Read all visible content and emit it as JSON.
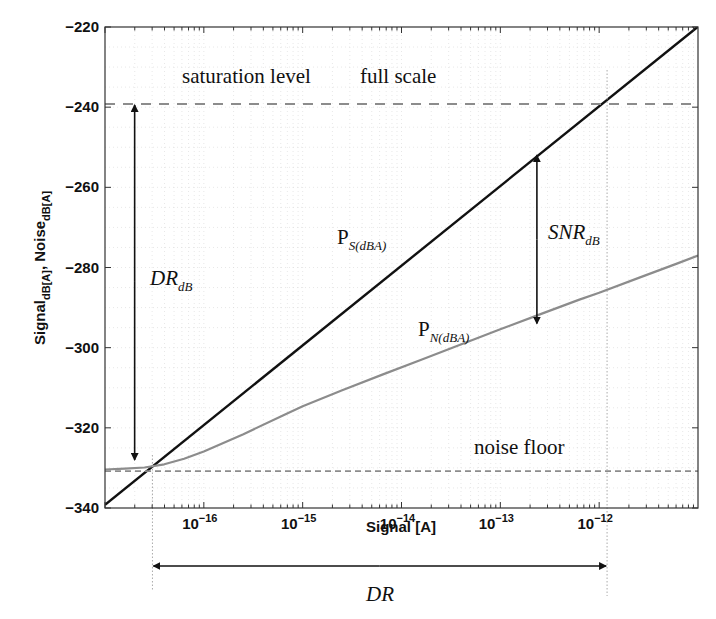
{
  "chart_data": {
    "type": "line",
    "title": "",
    "xlabel": "Signal [A]",
    "ylabel": "Signal_dB[A], Noise_dB[A]",
    "ylabel_parts": {
      "a": "Signal",
      "a_sub": "dB[A]",
      "sep": ", ",
      "b": "Noise",
      "b_sub": "dB[A]"
    },
    "xscale": "log",
    "xlim": [
      1e-17,
      1e-11
    ],
    "ylim": [
      -340,
      -220
    ],
    "grid": true,
    "x_ticks": [
      {
        "exp": -16,
        "base": "10",
        "sup": "−16"
      },
      {
        "exp": -15,
        "base": "10",
        "sup": "−15"
      },
      {
        "exp": -14,
        "base": "10",
        "sup": "−14"
      },
      {
        "exp": -13,
        "base": "10",
        "sup": "−13"
      },
      {
        "exp": -12,
        "base": "10",
        "sup": "−12"
      }
    ],
    "y_ticks": [
      {
        "value": -220,
        "label": "−220"
      },
      {
        "value": -240,
        "label": "−240"
      },
      {
        "value": -260,
        "label": "−260"
      },
      {
        "value": -280,
        "label": "−280"
      },
      {
        "value": -300,
        "label": "−300"
      },
      {
        "value": -320,
        "label": "−320"
      },
      {
        "value": -340,
        "label": "−340"
      }
    ],
    "series": [
      {
        "name": "P_S(dBA)",
        "color": "#111111",
        "style": "solid",
        "log10_x": [
          -17,
          -11
        ],
        "y": [
          -339.2,
          -219.9
        ]
      },
      {
        "name": "P_N(dBA)",
        "color": "#8c8c8c",
        "style": "solid",
        "log10_x": [
          -17,
          -16.8,
          -16.6,
          -16.4,
          -16.2,
          -16.0,
          -15.6,
          -15.2,
          -15.0,
          -14.6,
          -14.2,
          -13.8,
          -13.4,
          -13.0,
          -12.6,
          -12.2,
          -12.0,
          -11.6,
          -11.2,
          -11.0
        ],
        "y": [
          -330.4,
          -330.2,
          -329.9,
          -329.1,
          -327.7,
          -325.9,
          -321.6,
          -316.9,
          -314.6,
          -310.6,
          -306.8,
          -303.0,
          -299.2,
          -295.4,
          -291.7,
          -288.0,
          -286.3,
          -282.6,
          -278.9,
          -277.0
        ]
      },
      {
        "name": "saturation level",
        "color": "#8c8c8c",
        "style": "dashed",
        "log10_x": [
          -17,
          -11
        ],
        "y": [
          -239.2,
          -239.2
        ]
      },
      {
        "name": "noise floor",
        "color": "#8c8c8c",
        "style": "dashed",
        "log10_x": [
          -17,
          -11
        ],
        "y": [
          -330.8,
          -330.8
        ]
      }
    ],
    "annotations": {
      "saturation_label": "saturation level",
      "full_scale_label": "full scale",
      "noise_floor_label": "noise floor",
      "ps_label": {
        "main": "P",
        "sub": "S(dBA)"
      },
      "pn_label": {
        "main": "P",
        "sub": "N(dBA)"
      },
      "dr_db_label": {
        "main": "DR",
        "sub": "dB"
      },
      "snr_db_label": {
        "main": "SNR",
        "sub": "dB"
      },
      "dr_label": "DR",
      "dr_db_arrow": {
        "log10_x": -16.7,
        "y_top": -239.2,
        "y_bottom": -328.0
      },
      "snr_arrow": {
        "log10_x": -12.63,
        "y_top": -252.0,
        "y_bottom": -294.0
      },
      "dr_arrow": {
        "log10_x_left": -16.52,
        "log10_x_right": -11.92
      },
      "vertical_markers_log10_x": [
        -16.52,
        -11.92
      ]
    }
  }
}
